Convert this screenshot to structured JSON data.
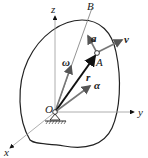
{
  "diagram": {
    "labels": {
      "z": "z",
      "y": "y",
      "x": "x",
      "B": "B",
      "A": "A",
      "O": "O",
      "omega": "ω",
      "alpha": "α",
      "r": "r",
      "v": "v",
      "a": "a"
    },
    "colors": {
      "outline": "#222222",
      "vector_gray": "#7a7a7a",
      "axis": "#9a9a9a"
    }
  }
}
